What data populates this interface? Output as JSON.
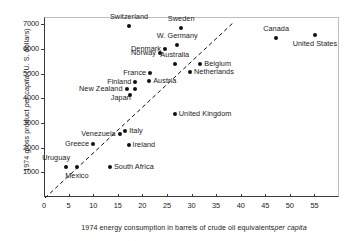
{
  "chart_data": {
    "type": "scatter",
    "title": "",
    "xlabel": "1974 energy consumption in barrels of crude oil equivalents per capita",
    "ylabel": "1974 gross product per capita (U.S. dollars)",
    "xlim": [
      0,
      60
    ],
    "ylim": [
      0,
      7300
    ],
    "grid": false,
    "legend": "none",
    "xticks": [
      0,
      5,
      10,
      15,
      20,
      25,
      30,
      35,
      40,
      45,
      50,
      55
    ],
    "yticks": [
      1000,
      2000,
      3000,
      4000,
      5000,
      6000,
      7000
    ],
    "annotations": [
      {
        "name": "trend-line",
        "type": "dashed-line",
        "x0": 0,
        "y0": 0,
        "x1": 38.5,
        "y1": 7150
      }
    ],
    "points": [
      {
        "label": "Switzerland",
        "x": 17.3,
        "y": 6930,
        "label_pos": "above"
      },
      {
        "label": "Sweden",
        "x": 27.9,
        "y": 6860,
        "label_pos": "above"
      },
      {
        "label": "Canada",
        "x": 47.2,
        "y": 6440,
        "label_pos": "above"
      },
      {
        "label": "United States",
        "x": 55.1,
        "y": 6570,
        "label_pos": "below"
      },
      {
        "label": "W. Germany",
        "x": 27.1,
        "y": 6180,
        "label_pos": "above"
      },
      {
        "label": "Denmark",
        "x": 24.6,
        "y": 6010,
        "label_pos": "left"
      },
      {
        "label": "Norway",
        "x": 23.6,
        "y": 5830,
        "label_pos": "left"
      },
      {
        "label": "Australia",
        "x": 26.6,
        "y": 5400,
        "label_pos": "above"
      },
      {
        "label": "Belgium",
        "x": 31.8,
        "y": 5380,
        "label_pos": "right"
      },
      {
        "label": "Netherlands",
        "x": 29.7,
        "y": 5080,
        "label_pos": "right"
      },
      {
        "label": "France",
        "x": 21.6,
        "y": 5030,
        "label_pos": "left"
      },
      {
        "label": "Austria",
        "x": 21.4,
        "y": 4690,
        "label_pos": "right"
      },
      {
        "label": "Finland",
        "x": 18.6,
        "y": 4680,
        "label_pos": "left"
      },
      {
        "label": "New Zealand",
        "x": 16.8,
        "y": 4400,
        "label_pos": "left"
      },
      {
        "label": "Japan",
        "x": 18.5,
        "y": 4380,
        "label_pos": "below-left"
      },
      {
        "label": "",
        "x": 17.4,
        "y": 4150,
        "label_pos": "none"
      },
      {
        "label": "United Kingdom",
        "x": 26.6,
        "y": 3380,
        "label_pos": "right"
      },
      {
        "label": "Italy",
        "x": 16.5,
        "y": 2660,
        "label_pos": "right"
      },
      {
        "label": "Venezuela",
        "x": 15.4,
        "y": 2570,
        "label_pos": "left"
      },
      {
        "label": "Greece",
        "x": 10.0,
        "y": 2150,
        "label_pos": "left"
      },
      {
        "label": "Ireland",
        "x": 17.2,
        "y": 2120,
        "label_pos": "right"
      },
      {
        "label": "Mexico",
        "x": 6.7,
        "y": 1220,
        "label_pos": "below"
      },
      {
        "label": "Uruguay",
        "x": 4.5,
        "y": 1200,
        "label_pos": "above-left"
      },
      {
        "label": "South Africa",
        "x": 13.4,
        "y": 1230,
        "label_pos": "right"
      }
    ]
  },
  "axis": {
    "y_title_parts": {
      "a": "1974 gross product ",
      "b": "per capita",
      "c": " (U. S. dollars)"
    },
    "x_title_parts": {
      "a": "1974 energy consumption in barrels of crude oil equivalents",
      "b": "per capita"
    }
  }
}
